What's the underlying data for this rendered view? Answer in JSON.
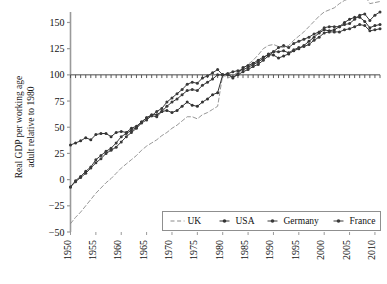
{
  "chart_data": {
    "type": "line",
    "title": "",
    "xlabel": "",
    "ylabel": "Real GDP per working age adult relative to 1980",
    "ylabel_line1": "Real GDP per working age",
    "ylabel_line2": "adult relative to 1980",
    "xlim": [
      1950,
      2011
    ],
    "ylim": [
      -50,
      160
    ],
    "yticks": [
      -50,
      -25,
      0,
      25,
      50,
      75,
      100,
      125,
      150
    ],
    "ytick_labels": [
      "−50",
      "−25",
      "0",
      "25",
      "50",
      "75",
      "100",
      "125",
      "150"
    ],
    "xticks": [
      1950,
      1955,
      1960,
      1965,
      1970,
      1975,
      1980,
      1985,
      1990,
      1995,
      2000,
      2005,
      2010
    ],
    "xtick_labels": [
      "1950",
      "1955",
      "1960",
      "1965",
      "1970",
      "1975",
      "1980",
      "1985",
      "1990",
      "1995",
      "2000",
      "2005",
      "2010"
    ],
    "grid": false,
    "reference_line": {
      "y": 100,
      "label": "1980 = 100",
      "ticks_per_year": true
    },
    "legend_position": "bottom-center",
    "x": [
      1950,
      1951,
      1952,
      1953,
      1954,
      1955,
      1956,
      1957,
      1958,
      1959,
      1960,
      1961,
      1962,
      1963,
      1964,
      1965,
      1966,
      1967,
      1968,
      1969,
      1970,
      1971,
      1972,
      1973,
      1974,
      1975,
      1976,
      1977,
      1978,
      1979,
      1980,
      1981,
      1982,
      1983,
      1984,
      1985,
      1986,
      1987,
      1988,
      1989,
      1990,
      1991,
      1992,
      1993,
      1994,
      1995,
      1996,
      1997,
      1998,
      1999,
      2000,
      2001,
      2002,
      2003,
      2004,
      2005,
      2006,
      2007,
      2008,
      2009,
      2010,
      2011
    ],
    "series": [
      {
        "name": "UK",
        "style": "dashed",
        "color": "#8a8a8a",
        "marker": "none",
        "values": [
          -42,
          -36,
          -31,
          -25,
          -19,
          -13,
          -8,
          -3,
          1,
          6,
          11,
          15,
          19,
          23,
          28,
          32,
          35,
          38,
          42,
          45,
          49,
          52,
          56,
          60,
          60,
          58,
          62,
          64,
          67,
          70,
          100,
          97,
          99,
          103,
          106,
          110,
          114,
          119,
          125,
          128,
          129,
          127,
          126,
          128,
          133,
          137,
          141,
          146,
          151,
          156,
          160,
          162,
          164,
          168,
          171,
          173,
          176,
          178,
          176,
          168,
          169,
          170
        ]
      },
      {
        "name": "USA",
        "style": "solid",
        "color": "#333333",
        "marker": "dot",
        "values": [
          33,
          35,
          37,
          40,
          38,
          43,
          44,
          44,
          41,
          45,
          46,
          45,
          49,
          51,
          55,
          59,
          62,
          62,
          65,
          66,
          64,
          66,
          70,
          74,
          71,
          70,
          74,
          77,
          81,
          83,
          100,
          101,
          97,
          101,
          107,
          109,
          111,
          114,
          117,
          119,
          119,
          116,
          118,
          120,
          123,
          125,
          128,
          132,
          136,
          140,
          143,
          142,
          143,
          146,
          150,
          153,
          155,
          155,
          151,
          145,
          147,
          148
        ]
      },
      {
        "name": "Germany",
        "style": "solid",
        "color": "#3a3a3a",
        "marker": "dot",
        "values": [
          -7,
          -1,
          3,
          8,
          12,
          19,
          23,
          27,
          30,
          35,
          41,
          44,
          47,
          50,
          55,
          59,
          61,
          60,
          65,
          70,
          74,
          77,
          81,
          85,
          86,
          85,
          90,
          93,
          96,
          100,
          100,
          100,
          98,
          100,
          103,
          105,
          108,
          110,
          114,
          118,
          122,
          126,
          128,
          126,
          130,
          132,
          134,
          136,
          139,
          141,
          145,
          146,
          146,
          146,
          148,
          149,
          153,
          157,
          158,
          152,
          157,
          160
        ]
      },
      {
        "name": "France",
        "style": "solid",
        "color": "#3a3a3a",
        "marker": "dot",
        "values": [
          -7,
          -2,
          2,
          6,
          11,
          16,
          20,
          25,
          28,
          31,
          36,
          41,
          45,
          49,
          54,
          57,
          61,
          65,
          68,
          74,
          78,
          82,
          86,
          91,
          93,
          92,
          97,
          99,
          102,
          105,
          100,
          101,
          103,
          104,
          105,
          107,
          110,
          112,
          116,
          120,
          122,
          122,
          123,
          121,
          124,
          126,
          127,
          129,
          133,
          136,
          140,
          141,
          141,
          141,
          143,
          144,
          146,
          148,
          147,
          142,
          143,
          144
        ]
      }
    ],
    "legend_entries": [
      {
        "label": "UK",
        "style": "dashed",
        "marker": "none",
        "color": "#8a8a8a"
      },
      {
        "label": "USA",
        "style": "solid",
        "marker": "dot",
        "color": "#333333"
      },
      {
        "label": "Germany",
        "style": "solid",
        "marker": "dot",
        "color": "#3a3a3a"
      },
      {
        "label": "France",
        "style": "solid",
        "marker": "dot",
        "color": "#3a3a3a"
      }
    ]
  },
  "axis": {
    "ylabel_line1": "Real GDP per working age",
    "ylabel_line2": "adult relative to 1980"
  }
}
